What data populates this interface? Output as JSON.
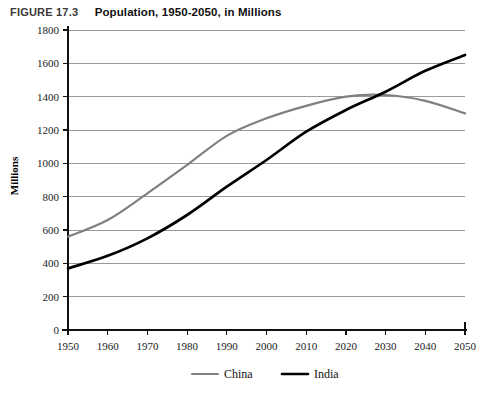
{
  "figure": {
    "number_label": "FIGURE 17.3",
    "caption": "Population, 1950-2050, in Millions"
  },
  "colors": {
    "china_line": "#808080",
    "india_line": "#000000",
    "gridline": "#9a9a9a",
    "axis": "#111111",
    "background": "#ffffff"
  },
  "chart_data": {
    "type": "line",
    "title": "Population, 1950-2050, in Millions",
    "xlabel": "",
    "ylabel": "Millions",
    "x": [
      1950,
      1960,
      1970,
      1980,
      1990,
      2000,
      2010,
      2020,
      2030,
      2040,
      2050
    ],
    "xtick_labels": [
      "1950",
      "1960",
      "1970",
      "1980",
      "1990",
      "2000",
      "2010",
      "2020",
      "2030",
      "2040",
      "2050"
    ],
    "ytick_labels": [
      "0",
      "200",
      "400",
      "600",
      "800",
      "1000",
      "1200",
      "1400",
      "1600",
      "1800"
    ],
    "yticks": [
      0,
      200,
      400,
      600,
      800,
      1000,
      1200,
      1400,
      1600,
      1800
    ],
    "xlim": [
      1950,
      2050
    ],
    "ylim": [
      0,
      1800
    ],
    "grid": true,
    "legend_position": "bottom",
    "series": [
      {
        "name": "China",
        "color": "#808080",
        "values": [
          560,
          660,
          820,
          990,
          1165,
          1270,
          1345,
          1400,
          1410,
          1375,
          1300
        ]
      },
      {
        "name": "India",
        "color": "#000000",
        "values": [
          370,
          445,
          550,
          690,
          860,
          1020,
          1190,
          1320,
          1430,
          1555,
          1650
        ]
      }
    ]
  },
  "legend": {
    "items": [
      {
        "label": "China",
        "color": "#808080",
        "width": 2.2
      },
      {
        "label": "India",
        "color": "#000000",
        "width": 2.6
      }
    ]
  }
}
